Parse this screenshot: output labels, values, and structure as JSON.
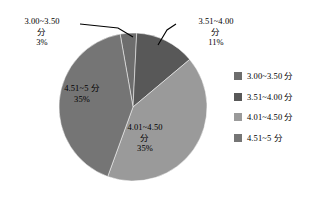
{
  "chart_data": {
    "type": "pie",
    "title": "",
    "subtitle": "",
    "xlabel": "",
    "ylabel": "",
    "grid": false,
    "legend_position": "right",
    "categories": [
      "3.00~3.50 分",
      "3.51~4.00 分",
      "4.01~4.50 分",
      "4.51~5 分"
    ],
    "values": [
      3,
      11,
      35,
      35
    ],
    "value_unit": "%",
    "colors": [
      "#6d6d6d",
      "#585858",
      "#9a9a9a",
      "#757575"
    ],
    "slices": [
      {
        "name": "3.00~3.50 分",
        "percent": 3,
        "percent_text": "3%",
        "label_line1": "3.00~3.50",
        "label_line2": "分",
        "label_line3": "3%",
        "color": "#6d6d6d",
        "label_placement": "callout-outside-left"
      },
      {
        "name": "3.51~4.00 分",
        "percent": 11,
        "percent_text": "11%",
        "label_line1": "3.51~4.00",
        "label_line2": "分",
        "label_line3": "11%",
        "color": "#585858",
        "label_placement": "callout-outside-right"
      },
      {
        "name": "4.01~4.50 分",
        "percent": 35,
        "percent_text": "35%",
        "label_line1": "4.01~4.50",
        "label_line2": "分",
        "label_line3": "35%",
        "color": "#9a9a9a",
        "label_placement": "inside"
      },
      {
        "name": "4.51~5 分",
        "percent": 35,
        "percent_text": "35%",
        "label_line1": "4.51~5 分",
        "label_line2": "35%",
        "label_line3": "",
        "color": "#757575",
        "label_placement": "inside"
      }
    ]
  },
  "legend": {
    "items": [
      {
        "label": "3.00~3.50 分",
        "color": "#6d6d6d"
      },
      {
        "label": "3.51~4.00 分",
        "color": "#585858"
      },
      {
        "label": "4.01~4.50 分",
        "color": "#9a9a9a"
      },
      {
        "label": "4.51~5 分",
        "color": "#757575"
      }
    ]
  },
  "canvas": {
    "background": "#ffffff",
    "text_color": "#000000"
  }
}
